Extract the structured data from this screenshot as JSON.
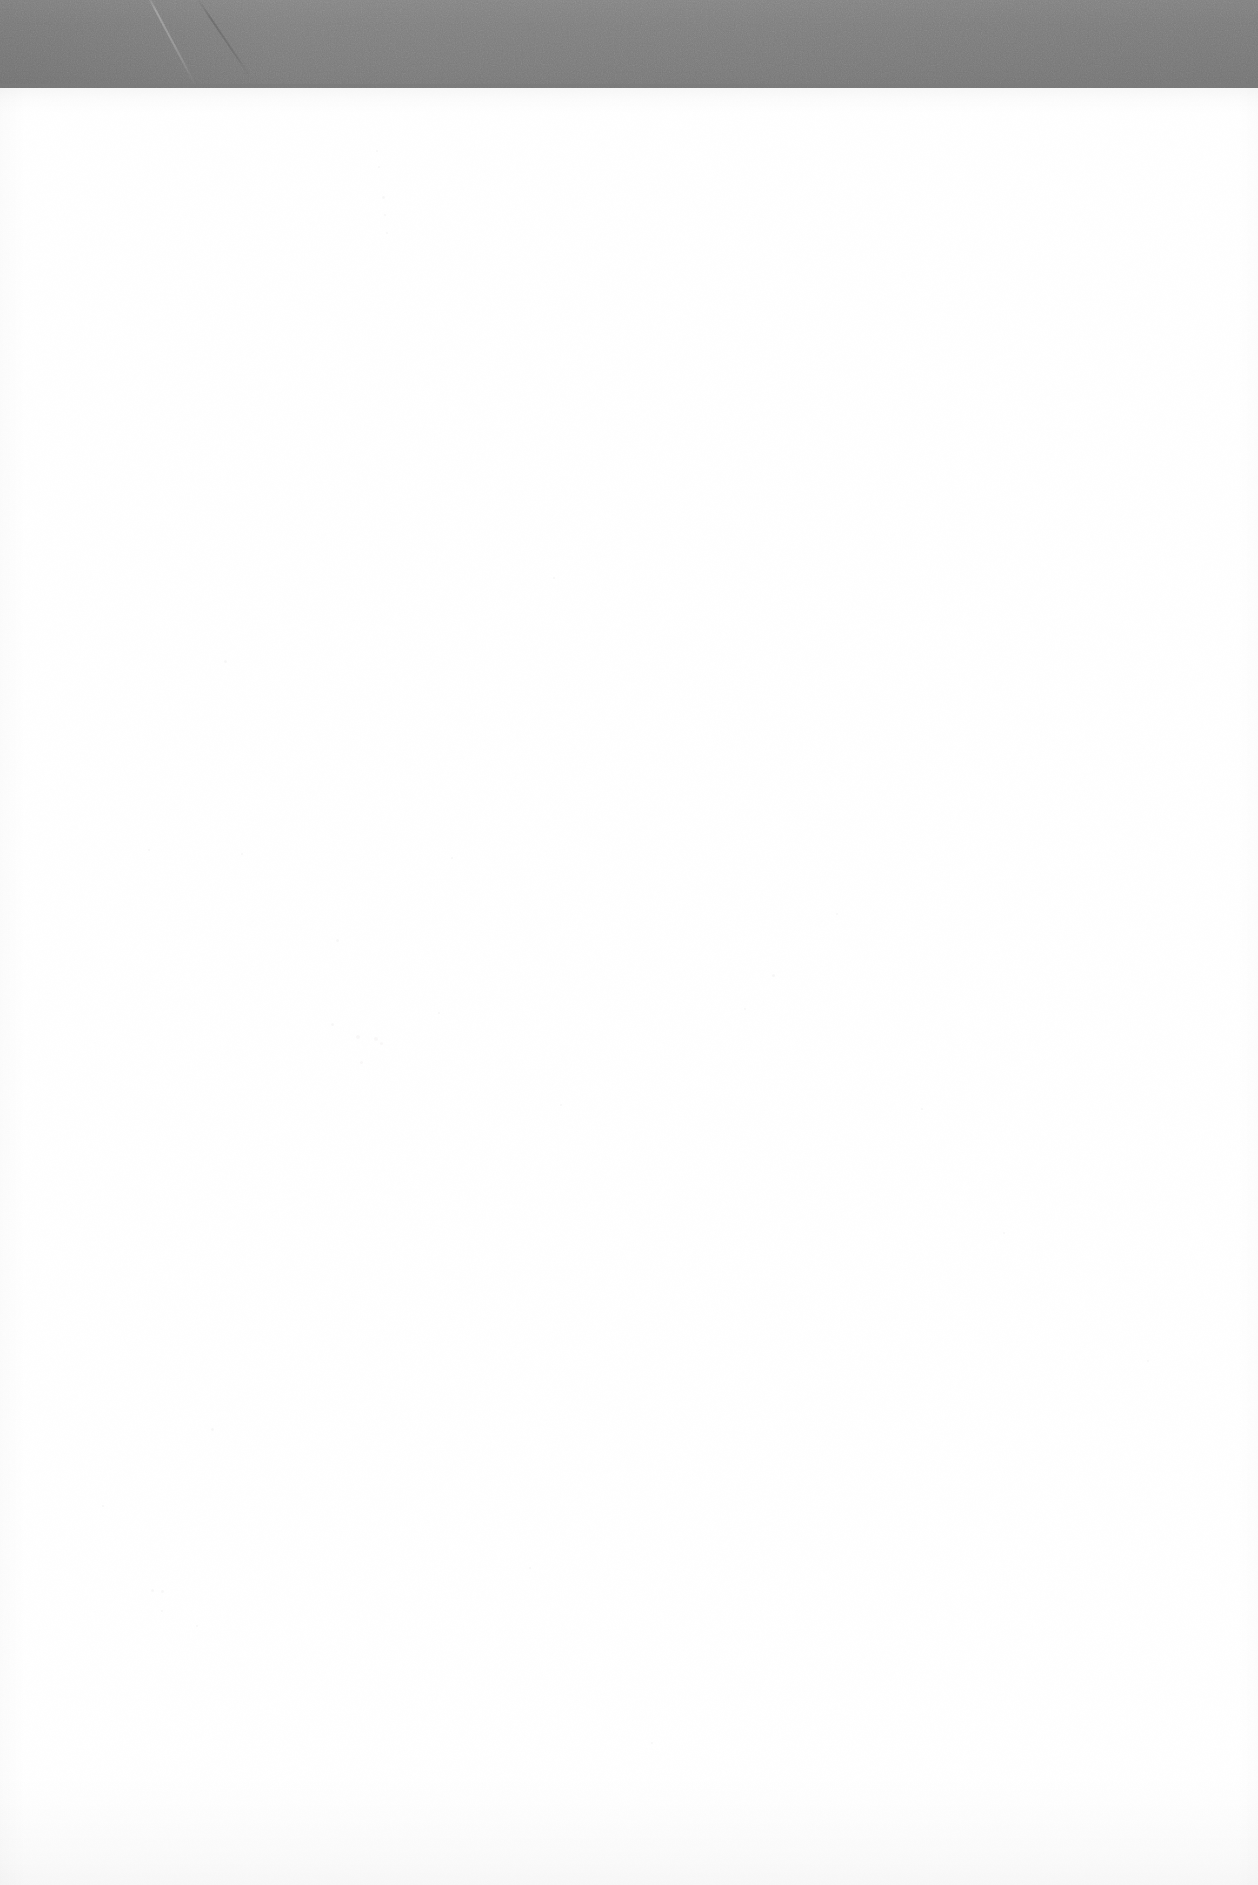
{
  "document": {
    "kind": "scanned-page",
    "page_state": "blank",
    "width_px": 1258,
    "height_px": 1885,
    "visible_text": "",
    "notes": "No legible text, headings, figures or UI controls are rendered on this page."
  },
  "scan_band": {
    "name": "scanner-top-band",
    "color": "#7b7b7b",
    "height_px": 90,
    "spans_full_width": true,
    "artifacts": [
      {
        "name": "diagonal-crease-light",
        "x_px": 146,
        "angle_deg": -28
      },
      {
        "name": "diagonal-crease-dark",
        "x_px": 196,
        "angle_deg": -34
      }
    ]
  },
  "paper": {
    "name": "page-sheet",
    "color": "#ffffff",
    "top_px": 88,
    "height_px": 1797,
    "artifacts": {
      "top_ghost_band": {
        "name": "bleed-through-top",
        "height_px": 26
      },
      "bottom_ghost_band": {
        "name": "bleed-through-bottom",
        "height_px": 115
      },
      "dust_specks": [
        {
          "x": 376,
          "y": 150,
          "size": 2,
          "tone": "faint"
        },
        {
          "x": 378,
          "y": 166,
          "size": 2,
          "tone": "faint"
        },
        {
          "x": 382,
          "y": 196,
          "size": 3,
          "tone": "faint"
        },
        {
          "x": 384,
          "y": 214,
          "size": 2,
          "tone": "faint"
        },
        {
          "x": 386,
          "y": 232,
          "size": 2,
          "tone": "faint"
        },
        {
          "x": 224,
          "y": 660,
          "size": 3,
          "tone": "faint"
        },
        {
          "x": 451,
          "y": 857,
          "size": 2,
          "tone": "faint"
        },
        {
          "x": 553,
          "y": 577,
          "size": 2,
          "tone": "faint"
        },
        {
          "x": 836,
          "y": 913,
          "size": 2,
          "tone": "faint"
        },
        {
          "x": 772,
          "y": 974,
          "size": 3,
          "tone": "faint"
        },
        {
          "x": 744,
          "y": 1008,
          "size": 2,
          "tone": "faint"
        },
        {
          "x": 331,
          "y": 1023,
          "size": 3,
          "tone": "faint"
        },
        {
          "x": 336,
          "y": 939,
          "size": 3,
          "tone": "faint"
        },
        {
          "x": 356,
          "y": 1035,
          "size": 4,
          "tone": "warm"
        },
        {
          "x": 374,
          "y": 1037,
          "size": 4,
          "tone": "warm"
        },
        {
          "x": 360,
          "y": 1061,
          "size": 3,
          "tone": "warm"
        },
        {
          "x": 380,
          "y": 1042,
          "size": 3,
          "tone": "warm"
        },
        {
          "x": 438,
          "y": 1012,
          "size": 2,
          "tone": "faint"
        },
        {
          "x": 148,
          "y": 849,
          "size": 2,
          "tone": "faint"
        },
        {
          "x": 241,
          "y": 853,
          "size": 2,
          "tone": "faint"
        },
        {
          "x": 211,
          "y": 1428,
          "size": 3,
          "tone": "faint"
        },
        {
          "x": 151,
          "y": 1589,
          "size": 3,
          "tone": "faint"
        },
        {
          "x": 161,
          "y": 1590,
          "size": 3,
          "tone": "faint"
        },
        {
          "x": 161,
          "y": 1610,
          "size": 2,
          "tone": "faint"
        },
        {
          "x": 196,
          "y": 1625,
          "size": 2,
          "tone": "faint"
        },
        {
          "x": 529,
          "y": 1567,
          "size": 2,
          "tone": "faint"
        },
        {
          "x": 102,
          "y": 1505,
          "size": 2,
          "tone": "faint"
        },
        {
          "x": 560,
          "y": 1104,
          "size": 2,
          "tone": "faint"
        },
        {
          "x": 921,
          "y": 1108,
          "size": 2,
          "tone": "faint"
        },
        {
          "x": 1003,
          "y": 1232,
          "size": 2,
          "tone": "faint"
        },
        {
          "x": 651,
          "y": 1742,
          "size": 2,
          "tone": "faint"
        },
        {
          "x": 1147,
          "y": 1360,
          "size": 2,
          "tone": "faint"
        }
      ]
    }
  }
}
